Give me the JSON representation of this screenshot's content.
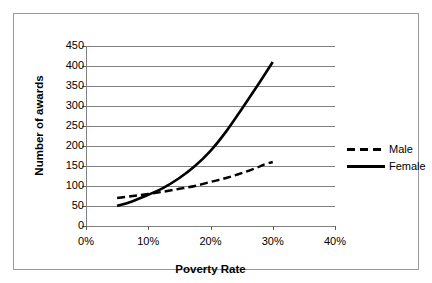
{
  "chart_data": {
    "type": "line",
    "title": "",
    "xlabel": "Poverty Rate",
    "ylabel": "Number of awards",
    "xlim": [
      0,
      40
    ],
    "ylim": [
      0,
      450
    ],
    "grid": true,
    "legend_position": "right",
    "x_tick_labels": [
      "0%",
      "10%",
      "20%",
      "30%",
      "40%"
    ],
    "x_ticks": [
      0,
      10,
      20,
      30,
      40
    ],
    "y_ticks": [
      0,
      50,
      100,
      150,
      200,
      250,
      300,
      350,
      400,
      450
    ],
    "y_tick_labels": [
      "0",
      "50",
      "100",
      "150",
      "200",
      "250",
      "300",
      "350",
      "400",
      "450"
    ],
    "series": [
      {
        "name": "Male",
        "style": "dashed",
        "color": "#000000",
        "x": [
          5,
          7.5,
          10,
          12.5,
          15,
          17.5,
          20,
          22.5,
          25,
          27.5,
          28.5,
          30
        ],
        "values": [
          70,
          75,
          80,
          86,
          93,
          100,
          110,
          120,
          132,
          146,
          153,
          160
        ]
      },
      {
        "name": "Female",
        "style": "solid",
        "color": "#000000",
        "x": [
          5,
          7.5,
          10,
          12.5,
          15,
          17.5,
          20,
          22.5,
          25,
          27.5,
          30
        ],
        "values": [
          50,
          62,
          78,
          96,
          120,
          150,
          188,
          236,
          292,
          350,
          410
        ]
      }
    ]
  },
  "legend": {
    "items": [
      {
        "label": "Male",
        "style": "dashed"
      },
      {
        "label": "Female",
        "style": "solid"
      }
    ]
  },
  "axes": {
    "x_title": "Poverty Rate",
    "y_title": "Number of awards"
  },
  "colors": {
    "series": "#000000",
    "gridline": "#808080",
    "frame": "#9a9a9a",
    "background": "#ffffff"
  }
}
